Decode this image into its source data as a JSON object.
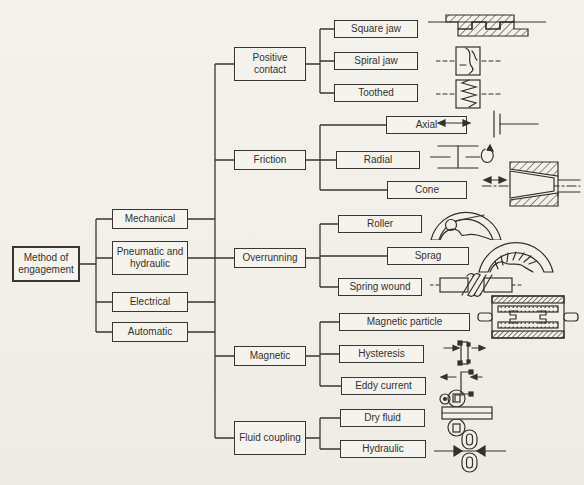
{
  "colors": {
    "ink": "#34312c",
    "paper": "#f2f0e9"
  },
  "tree": {
    "root": "Method of engagement",
    "branches": [
      "Mechanical",
      "Pneumatic and hydraulic",
      "Electrical",
      "Automatic"
    ],
    "categories": [
      {
        "label": "Positive contact",
        "types": [
          {
            "label": "Square jaw",
            "illustration": "square-jaw-section-drawing"
          },
          {
            "label": "Spiral jaw",
            "illustration": "spiral-jaw-section-drawing"
          },
          {
            "label": "Toothed",
            "illustration": "toothed-section-drawing"
          }
        ]
      },
      {
        "label": "Friction",
        "types": [
          {
            "label": "Axial",
            "illustration": "axial-plate-section-drawing"
          },
          {
            "label": "Radial",
            "illustration": "radial-drum-section-drawing"
          },
          {
            "label": "Cone",
            "illustration": "cone-section-drawing"
          }
        ]
      },
      {
        "label": "Overrunning",
        "types": [
          {
            "label": "Roller",
            "illustration": "roller-clutch-section-drawing"
          },
          {
            "label": "Sprag",
            "illustration": "sprag-clutch-section-drawing"
          },
          {
            "label": "Spring wound",
            "illustration": "spring-wound-section-drawing"
          }
        ]
      },
      {
        "label": "Magnetic",
        "types": [
          {
            "label": "Magnetic particle",
            "illustration": "magnetic-particle-section-drawing"
          },
          {
            "label": "Hysteresis",
            "illustration": "hysteresis-section-drawing"
          },
          {
            "label": "Eddy current",
            "illustration": "eddy-current-section-drawing"
          }
        ]
      },
      {
        "label": "Fluid coupling",
        "types": [
          {
            "label": "Dry fluid",
            "illustration": "dry-fluid-section-drawing"
          },
          {
            "label": "Hydraulic",
            "illustration": "hydraulic-section-drawing"
          }
        ]
      }
    ]
  }
}
